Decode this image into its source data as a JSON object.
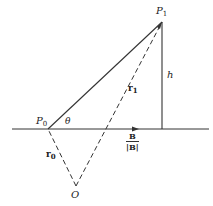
{
  "diagram": {
    "type": "geometry-vector-diagram",
    "points": {
      "P0": {
        "label": "P",
        "sub": "0",
        "x": 48,
        "y": 129
      },
      "P1": {
        "label": "P",
        "sub": "1",
        "x": 162,
        "y": 22
      },
      "O": {
        "label": "O",
        "x": 76,
        "y": 186
      },
      "foot": {
        "x": 162,
        "y": 129
      }
    },
    "labels": {
      "theta": "θ",
      "h": "h",
      "r1_main": "r",
      "r1_sub": "1",
      "r0_main": "r",
      "r0_sub": "0",
      "b_num": "B",
      "b_den": "|B|"
    },
    "lines": [
      {
        "name": "axis-line",
        "style": "solid",
        "from": [
          12,
          129
        ],
        "to": [
          209,
          129
        ]
      },
      {
        "name": "p0-p1-line",
        "style": "solid",
        "from": "P0",
        "to": "P1"
      },
      {
        "name": "height-line",
        "style": "solid",
        "from": "P1",
        "to": "foot"
      },
      {
        "name": "r1-vector",
        "style": "dashed",
        "from": "O",
        "to": "P1"
      },
      {
        "name": "r0-vector",
        "style": "dashed",
        "from": "O",
        "to": "P0"
      }
    ],
    "colors": {
      "stroke": "#333333",
      "background": "#ffffff"
    }
  }
}
